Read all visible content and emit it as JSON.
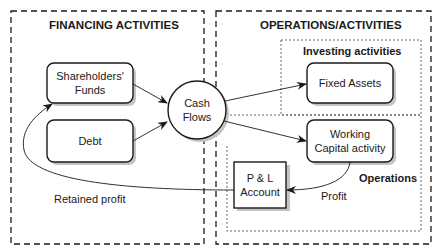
{
  "diagram": {
    "sections": {
      "financing": {
        "title": "FINANCING ACTIVITIES"
      },
      "operations": {
        "title": "OPERATIONS/ACTIVITIES"
      },
      "investing": {
        "title": "Investing activities"
      },
      "operations_sub": {
        "title": "Operations"
      }
    },
    "nodes": {
      "shareholders": {
        "line1": "Shareholders'",
        "line2": "Funds"
      },
      "debt": {
        "label": "Debt"
      },
      "cash_flows": {
        "line1": "Cash",
        "line2": "Flows"
      },
      "fixed_assets": {
        "label": "Fixed Assets"
      },
      "working_capital": {
        "line1": "Working",
        "line2": "Capital activity"
      },
      "pl_account": {
        "line1": "P & L",
        "line2": "Account"
      }
    },
    "edges": {
      "profit": "Profit",
      "retained_profit": "Retained profit"
    },
    "colors": {
      "stroke": "#1a1a1a",
      "shadow": "#b8b8b8",
      "background": "#ffffff"
    }
  }
}
